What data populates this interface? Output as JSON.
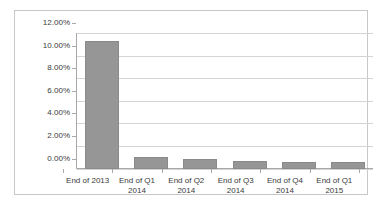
{
  "chart_data": {
    "type": "bar",
    "title": "",
    "subtitle": "",
    "xlabel": "",
    "ylabel": "",
    "categories": [
      "End of 2013",
      "End of Q1 2014",
      "End of Q2 2014",
      "End of Q3 2014",
      "End of Q4 2014",
      "End of Q1 2015"
    ],
    "category_lines": [
      [
        "End of 2013",
        ""
      ],
      [
        "End of Q1",
        "2014"
      ],
      [
        "End of Q2",
        "2014"
      ],
      [
        "End of Q3",
        "2014"
      ],
      [
        "End of Q4",
        "2014"
      ],
      [
        "End of Q1",
        "2015"
      ]
    ],
    "values": [
      11.3,
      1.0,
      0.8,
      0.65,
      0.55,
      0.6
    ],
    "value_labels": [
      "11.30%",
      "1.00%",
      "0.80%",
      "0.65%",
      "0.55%",
      "0.60%"
    ],
    "ylim": [
      0,
      12
    ],
    "ytick_values": [
      0,
      2,
      4,
      6,
      8,
      10,
      12
    ],
    "ytick_labels": [
      "0.00%",
      "2.00%",
      "4.00%",
      "6.00%",
      "8.00%",
      "10.00%",
      "12.00%"
    ],
    "grid": true,
    "legend": false,
    "legend_position": "none",
    "series_color": "#969696",
    "gridline_color": "#d4d4d4",
    "axis_color": "#a8a8a8",
    "border_color": "#c8c8c8",
    "background_color": "#ffffff",
    "text_color": "#3a3a3a"
  }
}
